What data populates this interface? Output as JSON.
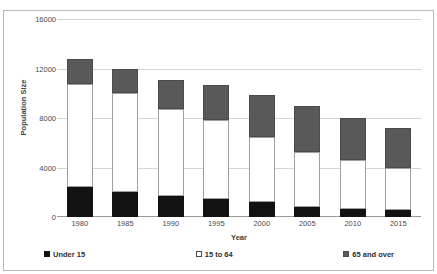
{
  "top_caption": "",
  "chart_data": {
    "type": "bar",
    "stacked": true,
    "title": "",
    "xlabel": "Year",
    "ylabel": "Population Size",
    "ylim": [
      0,
      16000
    ],
    "yticks": [
      16000,
      12000,
      8000,
      4000,
      0
    ],
    "grid": true,
    "legend_position": "bottom",
    "categories": [
      "1980",
      "1985",
      "1990",
      "1995",
      "2000",
      "2005",
      "2010",
      "2015"
    ],
    "series": [
      {
        "name": "Under 15",
        "color": "#121212",
        "values": [
          2450,
          2000,
          1700,
          1450,
          1180,
          840,
          620,
          550
        ]
      },
      {
        "name": "15 to 64",
        "color": "#ffffff",
        "values": [
          8300,
          8000,
          7000,
          6350,
          5250,
          4450,
          3980,
          3400
        ]
      },
      {
        "name": "65 and over",
        "color": "#595959",
        "values": [
          2050,
          1950,
          2400,
          2900,
          3400,
          3650,
          3400,
          3250
        ]
      }
    ],
    "totals": [
      12800,
      11950,
      11100,
      10700,
      9830,
      8940,
      8000,
      7200
    ]
  },
  "legend": [
    {
      "label": "Under 15",
      "swatch": "filled-black-square-icon"
    },
    {
      "label": "15 to 64",
      "swatch": "outlined-white-square-icon"
    },
    {
      "label": "65 and over",
      "swatch": "filled-gray-square-icon"
    }
  ]
}
